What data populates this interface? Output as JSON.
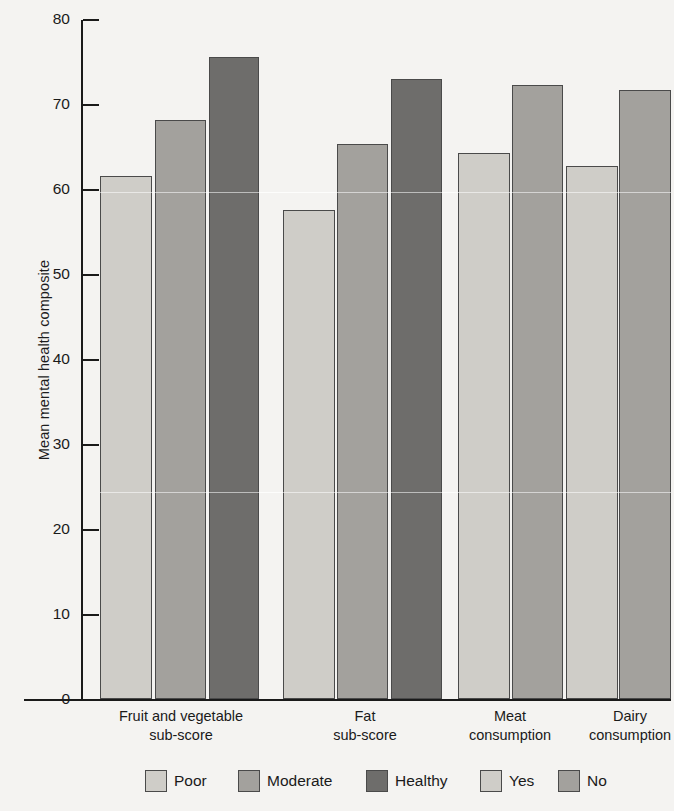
{
  "chart_data": {
    "type": "bar",
    "title": "",
    "xlabel": "",
    "ylabel": "Mean mental health composite",
    "ylim": [
      0,
      80
    ],
    "yticks": [
      0,
      10,
      20,
      30,
      40,
      50,
      60,
      70,
      80
    ],
    "ytick_labels": [
      "0",
      "10",
      "20",
      "30",
      "40",
      "50",
      "60",
      "70",
      "80"
    ],
    "grid": false,
    "legend_position": "bottom",
    "categories": [
      "Fruit and vegetable sub-score",
      "Fat sub-score",
      "Meat consumption",
      "Dairy consumption"
    ],
    "category_lines": [
      [
        "Fruit and vegetable",
        "sub-score"
      ],
      [
        "Fat",
        "sub-score"
      ],
      [
        "Meat",
        "consumption"
      ],
      [
        "Dairy",
        "consumption"
      ]
    ],
    "series": [
      {
        "name": "Poor",
        "values": [
          61.5,
          57.5,
          null,
          null
        ],
        "color": "#cfcdc8"
      },
      {
        "name": "Moderate",
        "values": [
          68.1,
          65.3,
          null,
          null
        ],
        "color": "#a3a19d"
      },
      {
        "name": "Healthy",
        "values": [
          75.5,
          72.9,
          null,
          null
        ],
        "color": "#6e6d6b"
      },
      {
        "name": "Yes",
        "values": [
          null,
          null,
          64.2,
          62.7
        ],
        "color": "#cfcdc8"
      },
      {
        "name": "No",
        "values": [
          null,
          null,
          72.2,
          71.7
        ],
        "color": "#a3a19d"
      }
    ],
    "bars": [
      {
        "group": "Fruit and vegetable sub-score",
        "series": "Poor",
        "value": 61.5,
        "color": "#cfcdc8"
      },
      {
        "group": "Fruit and vegetable sub-score",
        "series": "Moderate",
        "value": 68.1,
        "color": "#a3a19d"
      },
      {
        "group": "Fruit and vegetable sub-score",
        "series": "Healthy",
        "value": 75.5,
        "color": "#6e6d6b"
      },
      {
        "group": "Fat sub-score",
        "series": "Poor",
        "value": 57.5,
        "color": "#cfcdc8"
      },
      {
        "group": "Fat sub-score",
        "series": "Moderate",
        "value": 65.3,
        "color": "#a3a19d"
      },
      {
        "group": "Fat sub-score",
        "series": "Healthy",
        "value": 72.9,
        "color": "#6e6d6b"
      },
      {
        "group": "Meat consumption",
        "series": "Yes",
        "value": 64.2,
        "color": "#cfcdc8"
      },
      {
        "group": "Meat consumption",
        "series": "No",
        "value": 72.2,
        "color": "#a3a19d"
      },
      {
        "group": "Dairy consumption",
        "series": "Yes",
        "value": 62.7,
        "color": "#cfcdc8"
      },
      {
        "group": "Dairy consumption",
        "series": "No",
        "value": 71.7,
        "color": "#a3a19d"
      }
    ]
  },
  "legend": {
    "left_group": [
      {
        "label": "Poor",
        "color": "#cfcdc8"
      },
      {
        "label": "Moderate",
        "color": "#a3a19d"
      },
      {
        "label": "Healthy",
        "color": "#6e6d6b"
      }
    ],
    "right_group": [
      {
        "label": "Yes",
        "color": "#cfcdc8"
      },
      {
        "label": "No",
        "color": "#a3a19d"
      }
    ]
  },
  "colors": {
    "background": "#f4f3f1",
    "axis": "#1a1a1a",
    "bar_border": "#4a4a4a",
    "poor": "#cfcdc8",
    "moderate": "#a3a19d",
    "healthy": "#6e6d6b"
  }
}
